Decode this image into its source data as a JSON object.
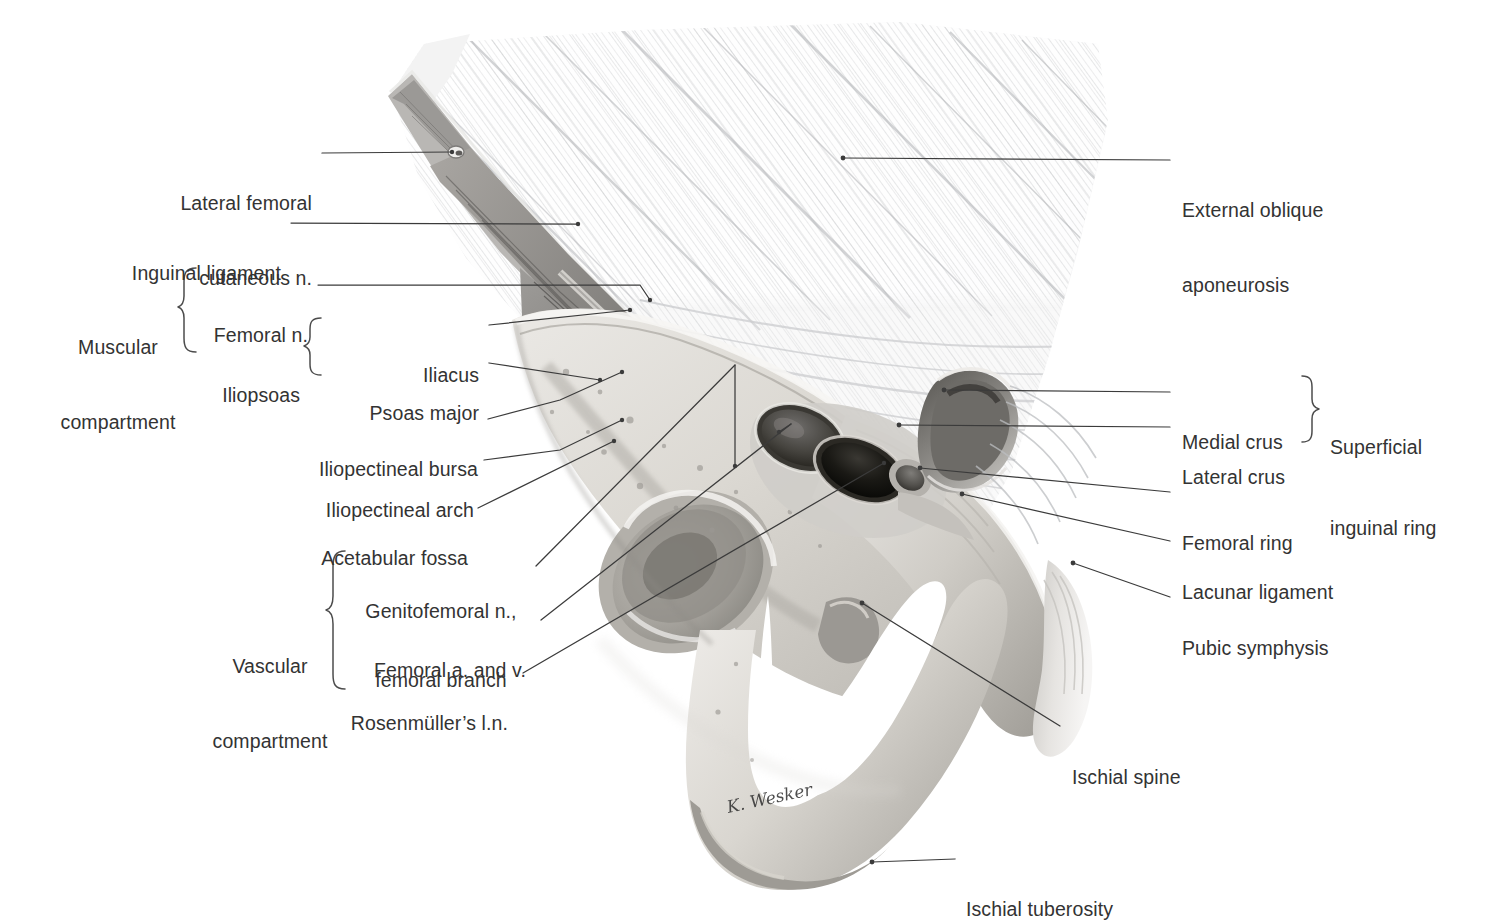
{
  "figure": {
    "type": "anatomical-illustration",
    "signature": "K. Wesker",
    "background_color": "#ffffff",
    "text_color": "#333333",
    "leader_color": "#3b3b3b"
  },
  "labels_left": [
    {
      "id": "lateral-femoral-cutaneous-n",
      "line1": "Lateral femoral",
      "line2": "cutaneous n."
    },
    {
      "id": "inguinal-ligament",
      "line1": "Inguinal ligament",
      "line2": ""
    },
    {
      "id": "femoral-n",
      "line1": "Femoral n.",
      "line2": ""
    },
    {
      "id": "iliacus",
      "line1": "Iliacus",
      "line2": ""
    },
    {
      "id": "psoas-major",
      "line1": "Psoas major",
      "line2": ""
    },
    {
      "id": "iliopectineal-bursa",
      "line1": "Iliopectineal bursa",
      "line2": ""
    },
    {
      "id": "iliopectineal-arch",
      "line1": "Iliopectineal arch",
      "line2": ""
    },
    {
      "id": "acetabular-fossa",
      "line1": "Acetabular fossa",
      "line2": ""
    },
    {
      "id": "genitofemoral-n",
      "line1": "Genitofemoral n.,",
      "line2": "femoral branch"
    },
    {
      "id": "femoral-a-and-v",
      "line1": "Femoral a. and v.",
      "line2": ""
    },
    {
      "id": "rosenmullers-ln",
      "line1": "Rosenmüller’s l.n.",
      "line2": ""
    }
  ],
  "labels_right": [
    {
      "id": "external-oblique-aponeurosis",
      "line1": "External oblique",
      "line2": "aponeurosis"
    },
    {
      "id": "medial-crus",
      "line1": "Medial crus",
      "line2": ""
    },
    {
      "id": "lateral-crus",
      "line1": "Lateral crus",
      "line2": ""
    },
    {
      "id": "femoral-ring",
      "line1": "Femoral ring",
      "line2": ""
    },
    {
      "id": "lacunar-ligament",
      "line1": "Lacunar ligament",
      "line2": ""
    },
    {
      "id": "pubic-symphysis",
      "line1": "Pubic symphysis",
      "line2": ""
    },
    {
      "id": "ischial-spine",
      "line1": "Ischial spine",
      "line2": ""
    },
    {
      "id": "ischial-tuberosity",
      "line1": "Ischial tuberosity",
      "line2": ""
    }
  ],
  "group_labels": [
    {
      "id": "muscular-compartment",
      "line1": "Muscular",
      "line2": "compartment"
    },
    {
      "id": "iliopsoas",
      "line1": "Iliopsoas",
      "line2": ""
    },
    {
      "id": "vascular-compartment",
      "line1": "Vascular",
      "line2": "compartment"
    },
    {
      "id": "superficial-inguinal-ring",
      "line1": "Superficial",
      "line2": "inguinal ring"
    }
  ]
}
